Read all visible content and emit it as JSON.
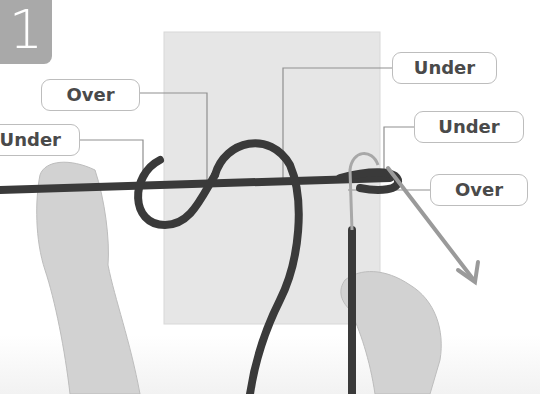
{
  "step": {
    "number": "1"
  },
  "labels": [
    {
      "id": "over-left",
      "text": "Over"
    },
    {
      "id": "under-left",
      "text": "Under"
    },
    {
      "id": "under-top",
      "text": "Under"
    },
    {
      "id": "under-right",
      "text": "Under"
    },
    {
      "id": "over-right",
      "text": "Over"
    }
  ],
  "colors": {
    "badge": "#a9a9a9",
    "rope": "#3a3a3a",
    "cloth": "#e6e6e6",
    "arrow": "#9a9a9a",
    "label_border": "#bdbdbd",
    "label_text": "#4a4a4a"
  }
}
